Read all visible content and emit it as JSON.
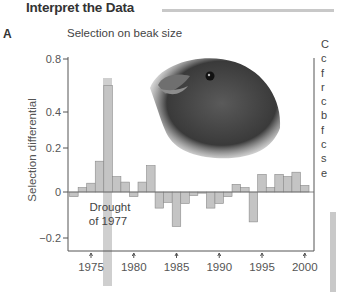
{
  "page": {
    "heading": "Interpret the Data",
    "panel_letter": "A",
    "right_column_fragment": [
      "C",
      "c",
      "f",
      "r",
      "c",
      "b",
      "f",
      "c",
      "s",
      "e"
    ]
  },
  "chart_data": {
    "type": "bar",
    "title": "Selection on beak size",
    "xlabel": "",
    "ylabel": "Selection differential",
    "x_tick_labels": [
      "1975",
      "1980",
      "1985",
      "1990",
      "1995",
      "2000"
    ],
    "y_tick_labels": [
      "0.8",
      "0.4",
      "0.2",
      "0",
      "−0.2"
    ],
    "y_ticks": [
      0.8,
      0.4,
      0.2,
      0,
      -0.2
    ],
    "ylim": [
      -0.2,
      0.8
    ],
    "grid": false,
    "legend": null,
    "annotation": {
      "text_line1": "Drought",
      "text_line2": "of 1977",
      "highlight_year": 1977
    },
    "categories": [
      1973,
      1974,
      1975,
      1976,
      1977,
      1978,
      1979,
      1980,
      1981,
      1982,
      1983,
      1984,
      1985,
      1986,
      1987,
      1988,
      1989,
      1990,
      1991,
      1992,
      1993,
      1994,
      1995,
      1996,
      1997,
      1998,
      1999,
      2000
    ],
    "values": [
      -0.02,
      0.02,
      0.04,
      0.14,
      0.6,
      0.07,
      0.045,
      -0.02,
      0.045,
      0.12,
      -0.07,
      -0.045,
      -0.15,
      -0.05,
      -0.015,
      -0.005,
      -0.07,
      -0.05,
      -0.02,
      0.035,
      0.02,
      -0.13,
      0.08,
      0.02,
      0.08,
      0.07,
      0.09,
      0.03
    ],
    "colors": {
      "bar_fill": "#c4c4c4",
      "bar_stroke": "#8a8a8a",
      "highlight": "#c8c8c8",
      "axis": "#555555"
    },
    "illustration": "finch-head"
  }
}
